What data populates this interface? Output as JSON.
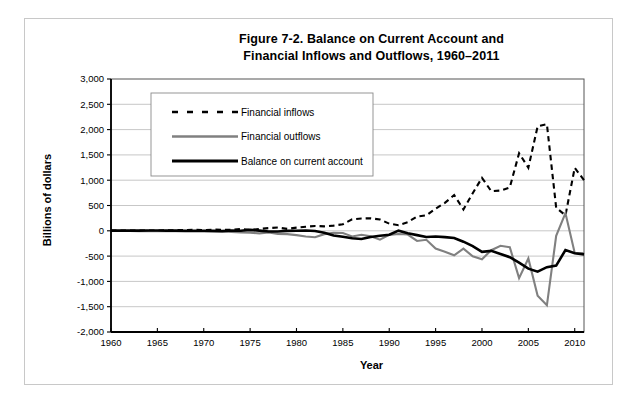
{
  "figure": {
    "title_line1": "Figure 7-2. Balance on Current Account and",
    "title_line2": "Financial Inflows and Outflows, 1960–2011"
  },
  "axes": {
    "y_title": "Billions of dollars",
    "x_title": "Year"
  },
  "chart_data": {
    "type": "line",
    "title": "Figure 7-2. Balance on Current Account and Financial Inflows and Outflows, 1960–2011",
    "xlabel": "Year",
    "ylabel": "Billions of dollars",
    "xlim": [
      1960,
      2011
    ],
    "ylim": [
      -2000,
      3000
    ],
    "grid": true,
    "grid_axis": "y",
    "legend_position": "upper-left-inside",
    "y_ticks": [
      3000,
      2500,
      2000,
      1500,
      1000,
      500,
      0,
      -500,
      -1000,
      -1500,
      -2000
    ],
    "y_tick_labels": [
      "3,000",
      "2,500",
      "2,000",
      "1,500",
      "1,000",
      "500",
      "0",
      "-500",
      "-1,000",
      "-1,500",
      "-2,000"
    ],
    "x_ticks": [
      1960,
      1965,
      1970,
      1975,
      1980,
      1985,
      1990,
      1995,
      2000,
      2005,
      2010
    ],
    "x_tick_labels": [
      "1960",
      "1965",
      "1970",
      "1975",
      "1980",
      "1985",
      "1990",
      "1995",
      "2000",
      "2005",
      "2010"
    ],
    "x": [
      1960,
      1961,
      1962,
      1963,
      1964,
      1965,
      1966,
      1967,
      1968,
      1969,
      1970,
      1971,
      1972,
      1973,
      1974,
      1975,
      1976,
      1977,
      1978,
      1979,
      1980,
      1981,
      1982,
      1983,
      1984,
      1985,
      1986,
      1987,
      1988,
      1989,
      1990,
      1991,
      1992,
      1993,
      1994,
      1995,
      1996,
      1997,
      1998,
      1999,
      2000,
      2001,
      2002,
      2003,
      2004,
      2005,
      2006,
      2007,
      2008,
      2009,
      2010,
      2011
    ],
    "series": [
      {
        "name": "Financial inflows",
        "style": "dashed",
        "color": "#000000",
        "width": 2.1,
        "values": [
          3,
          3,
          4,
          4,
          5,
          6,
          9,
          12,
          15,
          19,
          13,
          23,
          22,
          18,
          35,
          17,
          38,
          53,
          64,
          38,
          63,
          81,
          95,
          88,
          103,
          130,
          226,
          243,
          247,
          224,
          141,
          111,
          171,
          283,
          306,
          438,
          551,
          707,
          423,
          742,
          1047,
          783,
          795,
          858,
          1533,
          1247,
          2065,
          2108,
          454,
          306,
          1245,
          1000
        ]
      },
      {
        "name": "Financial outflows",
        "style": "solid",
        "color": "#808080",
        "width": 2.1,
        "values": [
          -4,
          -5,
          -4,
          -7,
          -9,
          -5,
          -7,
          -10,
          -11,
          -11,
          -9,
          -12,
          -14,
          -22,
          -34,
          -39,
          -51,
          -35,
          -61,
          -66,
          -86,
          -114,
          -127,
          -66,
          -40,
          -44,
          -111,
          -79,
          -107,
          -175,
          -81,
          -64,
          -74,
          -201,
          -178,
          -352,
          -413,
          -485,
          -353,
          -504,
          -561,
          -383,
          -295,
          -325,
          -936,
          -546,
          -1285,
          -1472,
          -100,
          350,
          -440,
          -445
        ]
      },
      {
        "name": "Balance on current account",
        "style": "solid",
        "color": "#000000",
        "width": 2.6,
        "values": [
          3,
          4,
          3,
          4,
          7,
          5,
          3,
          3,
          1,
          0,
          2,
          -1,
          -6,
          7,
          2,
          18,
          4,
          -14,
          -15,
          -1,
          2,
          5,
          -5,
          -38,
          -94,
          -118,
          -147,
          -161,
          -121,
          -99,
          -79,
          3,
          -50,
          -85,
          -122,
          -114,
          -125,
          -141,
          -215,
          -301,
          -416,
          -397,
          -458,
          -521,
          -631,
          -748,
          -807,
          -719,
          -687,
          -381,
          -443,
          -466
        ]
      }
    ]
  },
  "legend": {
    "items": [
      {
        "label": "Financial inflows",
        "swatch": "dashed-black"
      },
      {
        "label": "Financial outflows",
        "swatch": "solid-gray"
      },
      {
        "label": "Balance on current account",
        "swatch": "solid-black-thick"
      }
    ]
  }
}
